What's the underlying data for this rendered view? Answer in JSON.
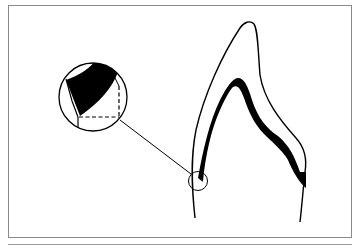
{
  "figure": {
    "type": "dental cross-section illustration",
    "elements": [
      {
        "name": "tooth-outline",
        "description": "Outline of tooth crown and root (pointed crown)"
      },
      {
        "name": "dark-layer-band",
        "description": "Black band following inner crown contour"
      },
      {
        "name": "detail-circle-small",
        "description": "Small circle marking region near margin"
      },
      {
        "name": "magnified-detail-circle",
        "description": "Enlarged inset of the marked region showing black band and dashed right-angle lines"
      },
      {
        "name": "leader-line",
        "description": "Line connecting small circle to magnified inset"
      }
    ],
    "colors": {
      "stroke": "#000000",
      "fill_dark": "#000000",
      "background": "#ffffff",
      "frame": "#8a8a8a"
    }
  }
}
